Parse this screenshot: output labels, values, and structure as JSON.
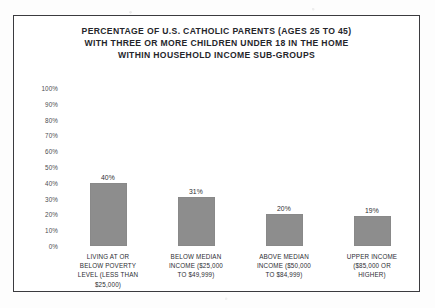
{
  "chart_data": {
    "type": "bar",
    "title": "PERCENTAGE OF U.S. CATHOLIC PARENTS (AGES 25 TO 45) WITH THREE OR MORE CHILDREN UNDER 18 IN THE HOME WITHIN HOUSEHOLD INCOME SUB-GROUPS",
    "title_lines": [
      "PERCENTAGE OF U.S. CATHOLIC PARENTS (AGES 25 TO 45)",
      "WITH THREE OR MORE CHILDREN UNDER 18 IN THE HOME",
      "WITHIN HOUSEHOLD INCOME SUB-GROUPS"
    ],
    "categories": [
      "LIVING AT OR BELOW POVERTY LEVEL (LESS THAN $25,000)",
      "BELOW MEDIAN INCOME ($25,000 TO $49,999)",
      "ABOVE MEDIAN INCOME ($50,000 TO $84,999)",
      "UPPER INCOME ($85,000 OR HIGHER)"
    ],
    "category_lines": [
      [
        "LIVING AT OR",
        "BELOW POVERTY",
        "LEVEL (LESS THAN",
        "$25,000)"
      ],
      [
        "BELOW MEDIAN",
        "INCOME ($25,000",
        "TO $49,999)"
      ],
      [
        "ABOVE MEDIAN",
        "INCOME ($50,000",
        "TO $84,999)"
      ],
      [
        "UPPER INCOME",
        "($85,000 OR",
        "HIGHER)"
      ]
    ],
    "values": [
      40,
      31,
      20,
      19
    ],
    "value_labels": [
      "40%",
      "31%",
      "20%",
      "19%"
    ],
    "xlabel": "",
    "ylabel": "",
    "ylim": [
      0,
      100
    ],
    "ytick_values": [
      100,
      90,
      80,
      70,
      60,
      50,
      40,
      30,
      20,
      10,
      0
    ],
    "ytick_labels": [
      "100%",
      "90%",
      "80%",
      "70%",
      "60%",
      "50%",
      "40%",
      "30%",
      "20%",
      "10%",
      "0%"
    ],
    "grid": false,
    "legend": "none",
    "bar_color": "#8d8d8d",
    "text_color": "#2d2e33",
    "border_color": "#3b3b3f",
    "background_color": "#ffffff"
  }
}
